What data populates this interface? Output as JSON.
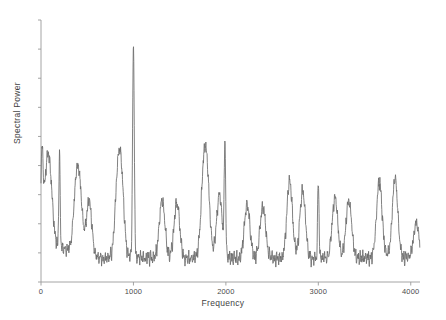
{
  "chart_data": {
    "type": "line",
    "title": "",
    "subtitle": "",
    "xlabel": "Frequency",
    "ylabel": "Spectral Power",
    "xlim": [
      0,
      4100
    ],
    "ylim": [
      0,
      1
    ],
    "xticks": [
      0,
      1000,
      2000,
      3000,
      4000
    ],
    "xtick_labels": [
      "0",
      "1000",
      "2000",
      "3000",
      "4000"
    ],
    "yticks": [],
    "ytick_labels": [],
    "grid": false,
    "legend": null,
    "line_color": "#6b6b6b",
    "axis_color": "#9a9a9a",
    "background": "#ffffff",
    "series": [
      {
        "name": "Spectral Power",
        "comment": "Noisy spectrum: baseline ~0.08 with dense high-frequency ripple, a dominant narrow peak at 1000 Hz, secondary peak at 2000 Hz, and a comb of moderate peaks roughly every 150-200 Hz.",
        "peaks": [
          {
            "x": 10,
            "y": 0.44,
            "label": "DC / low-frequency edge"
          },
          {
            "x": 60,
            "y": 0.34
          },
          {
            "x": 100,
            "y": 0.3
          },
          {
            "x": 200,
            "y": 0.47
          },
          {
            "x": 380,
            "y": 0.32
          },
          {
            "x": 420,
            "y": 0.3
          },
          {
            "x": 520,
            "y": 0.31
          },
          {
            "x": 830,
            "y": 0.37
          },
          {
            "x": 870,
            "y": 0.36
          },
          {
            "x": 1000,
            "y": 1.0,
            "label": "dominant peak"
          },
          {
            "x": 1310,
            "y": 0.32
          },
          {
            "x": 1470,
            "y": 0.31
          },
          {
            "x": 1760,
            "y": 0.4
          },
          {
            "x": 1800,
            "y": 0.34
          },
          {
            "x": 1930,
            "y": 0.34
          },
          {
            "x": 1990,
            "y": 0.56,
            "label": "second harmonic"
          },
          {
            "x": 2230,
            "y": 0.3
          },
          {
            "x": 2400,
            "y": 0.29
          },
          {
            "x": 2690,
            "y": 0.4
          },
          {
            "x": 2830,
            "y": 0.36
          },
          {
            "x": 3000,
            "y": 0.41
          },
          {
            "x": 3180,
            "y": 0.33
          },
          {
            "x": 3330,
            "y": 0.32
          },
          {
            "x": 3660,
            "y": 0.4
          },
          {
            "x": 3830,
            "y": 0.41
          },
          {
            "x": 4060,
            "y": 0.22
          }
        ],
        "baseline": 0.08
      }
    ]
  },
  "axes": {
    "x_title": "Frequency",
    "y_title": "Spectral Power",
    "x_tick_labels": [
      "0",
      "1000",
      "2000",
      "3000",
      "4000"
    ]
  }
}
